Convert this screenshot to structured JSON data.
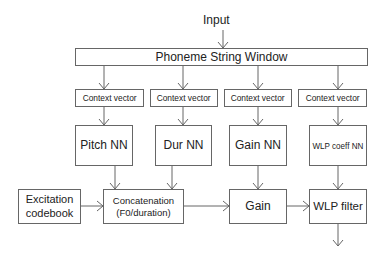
{
  "diagram": {
    "input_label": "Input",
    "phoneme_window": "Phoneme String Window",
    "context_vectors": [
      "Context vector",
      "Context vector",
      "Context vector",
      "Context vector"
    ],
    "networks": [
      "Pitch NN",
      "Dur NN",
      "Gain NN",
      "WLP coeff NN"
    ],
    "excitation": [
      "Excitation",
      "codebook"
    ],
    "concatenation": [
      "Concatenation",
      "(F0/duration)"
    ],
    "gain": "Gain",
    "wlp_filter": "WLP filter"
  },
  "colors": {
    "line": "#666666",
    "text": "#222222",
    "background": "#ffffff"
  }
}
